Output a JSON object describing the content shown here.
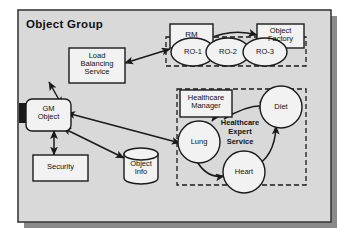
{
  "diagram": {
    "title": "Object Group",
    "background_color": "#ffffff",
    "panel_fill": "#d9d9d9",
    "panel_border": "#3a3a3a",
    "panel_shadow": "#8a8a8a",
    "node_fill": "#f2f2f2",
    "node_border": "#1a1a1a",
    "dashed_border": "#1a1a1a",
    "arrow_color": "#1a1a1a",
    "text_color": "#111111"
  },
  "groups": [
    {
      "id": "object-group",
      "label": "Object Group",
      "style": "solid-panel"
    },
    {
      "id": "replica-group",
      "label": "",
      "style": "dashed"
    },
    {
      "id": "healthcare-expert-service-group",
      "label": "Healthcare Expert Service",
      "style": "dashed"
    }
  ],
  "nodes": [
    {
      "id": "load-balancing-service",
      "label": "Load\nBalancing\nService",
      "shape": "rect"
    },
    {
      "id": "rm",
      "label": "RM",
      "shape": "rect"
    },
    {
      "id": "object-factory",
      "label": "Object\nFactory",
      "shape": "rect"
    },
    {
      "id": "ro-1",
      "label": "RO-1",
      "shape": "ellipse"
    },
    {
      "id": "ro-2",
      "label": "RO-2",
      "shape": "ellipse"
    },
    {
      "id": "ro-3",
      "label": "RO-3",
      "shape": "ellipse"
    },
    {
      "id": "gm-object",
      "label": "GM\nObject",
      "shape": "rounded-rect-with-tab"
    },
    {
      "id": "security",
      "label": "Security",
      "shape": "rect"
    },
    {
      "id": "object-info",
      "label": "Object\nInfo",
      "shape": "cylinder"
    },
    {
      "id": "healthcare-manager",
      "label": "Healthcare\nManager",
      "shape": "rect"
    },
    {
      "id": "lung",
      "label": "Lung",
      "shape": "circle"
    },
    {
      "id": "heart",
      "label": "Heart",
      "shape": "circle"
    },
    {
      "id": "diet",
      "label": "Diet",
      "shape": "circle"
    }
  ],
  "annotations": [
    {
      "id": "healthcare-expert-service-caption",
      "label": "Healthcare\nExpert\nService",
      "bold": true
    }
  ],
  "edges": [
    {
      "from": "gm-object",
      "to": "load-balancing-service",
      "arrow": "both"
    },
    {
      "from": "load-balancing-service",
      "to": "rm",
      "arrow": "both"
    },
    {
      "from": "rm",
      "to": "object-factory",
      "arrow": "to"
    },
    {
      "from": "gm-object",
      "to": "security",
      "arrow": "both"
    },
    {
      "from": "gm-object",
      "to": "object-info",
      "arrow": "both"
    },
    {
      "from": "gm-object",
      "to": "lung",
      "arrow": "both"
    },
    {
      "from": "healthcare-manager",
      "to": "diet",
      "arrow": "to"
    },
    {
      "from": "healthcare-manager",
      "to": "lung",
      "arrow": "to"
    },
    {
      "from": "lung",
      "to": "heart",
      "arrow": "to"
    },
    {
      "from": "heart",
      "to": "diet",
      "arrow": "both"
    }
  ]
}
